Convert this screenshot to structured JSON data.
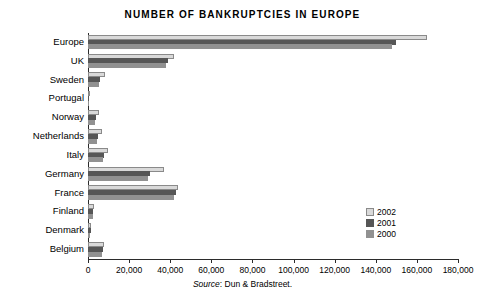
{
  "chart_data": {
    "type": "bar",
    "orientation": "horizontal",
    "title": "NUMBER OF BANKRUPTCIES IN EUROPE",
    "xlabel": "",
    "ylabel": "",
    "xlim": [
      0,
      180000
    ],
    "xticks": [
      0,
      20000,
      40000,
      60000,
      80000,
      100000,
      120000,
      140000,
      160000,
      180000
    ],
    "xtick_labels": [
      "0",
      "20,000",
      "40,000",
      "60,000",
      "80,000",
      "100,000",
      "120,000",
      "140,000",
      "160,000",
      "180,000"
    ],
    "grid": false,
    "legend_position": "bottom-right",
    "categories": [
      "Europe",
      "UK",
      "Sweden",
      "Portugal",
      "Norway",
      "Netherlands",
      "Italy",
      "Germany",
      "France",
      "Finland",
      "Denmark",
      "Belgium"
    ],
    "series": [
      {
        "name": "2002",
        "color": "#d9d9d9",
        "values": [
          165000,
          42000,
          8500,
          1000,
          5500,
          7000,
          9500,
          37000,
          44000,
          3000,
          1500,
          8000
        ]
      },
      {
        "name": "2001",
        "color": "#565656",
        "values": [
          150000,
          39000,
          6000,
          700,
          4000,
          5000,
          8000,
          30000,
          43000,
          2500,
          1300,
          7500
        ]
      },
      {
        "name": "2000",
        "color": "#919191",
        "values": [
          148000,
          38000,
          5500,
          600,
          3500,
          4500,
          7500,
          29000,
          42000,
          2200,
          1200,
          7000
        ]
      }
    ],
    "source_prefix": "Source",
    "source_text": ": Dun & Bradstreet."
  }
}
